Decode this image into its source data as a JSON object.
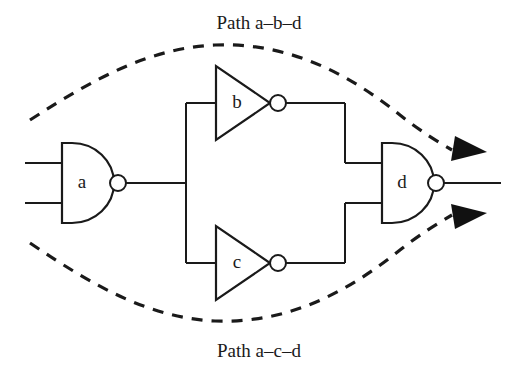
{
  "figure": {
    "background_color": "#ffffff",
    "line_color": "#1a1a1a",
    "title": ""
  },
  "labels": {
    "top_path": "Path a–b–d",
    "bottom_path": "Path a–c–d"
  },
  "gates": [
    {
      "id": "a",
      "label": "a",
      "type": "nand",
      "shape": "d-shape-with-bubble",
      "inputs": 2,
      "position": {
        "x": 61,
        "y": 183
      }
    },
    {
      "id": "b",
      "label": "b",
      "type": "inverter",
      "shape": "triangle-with-bubble",
      "inputs": 1,
      "position": {
        "x": 215,
        "y": 103
      }
    },
    {
      "id": "c",
      "label": "c",
      "type": "inverter",
      "shape": "triangle-with-bubble",
      "inputs": 1,
      "position": {
        "x": 215,
        "y": 263
      }
    },
    {
      "id": "d",
      "label": "d",
      "type": "nand",
      "shape": "d-shape-with-bubble",
      "inputs": 2,
      "position": {
        "x": 381,
        "y": 183
      }
    }
  ],
  "paths": [
    {
      "name": "path-a-b-d",
      "nodes": [
        "a",
        "b",
        "d"
      ],
      "style": "dashed",
      "label": "Path a–b–d"
    },
    {
      "name": "path-a-c-d",
      "nodes": [
        "a",
        "c",
        "d"
      ],
      "style": "dashed",
      "label": "Path a–c–d"
    }
  ]
}
